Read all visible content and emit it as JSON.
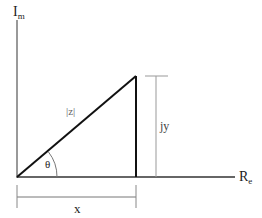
{
  "diagram": {
    "axes": {
      "y_label": "I",
      "y_label_sub": "m",
      "x_label": "R",
      "x_label_sub": "e"
    },
    "labels": {
      "hypotenuse": "|z|",
      "angle": "θ",
      "vertical_side": "jy",
      "horizontal_side": "x"
    },
    "colors": {
      "primary_line": "#111111",
      "dimension_line": "#999999"
    }
  }
}
